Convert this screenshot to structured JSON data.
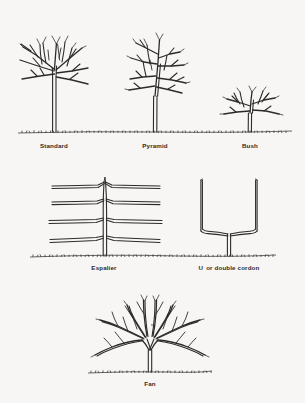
{
  "figure": {
    "background_color": "#f7f6f4",
    "ink_color": "#2b2b2b"
  },
  "rows": [
    {
      "name": "free-standing-forms",
      "items": [
        {
          "key": "standard",
          "label": "Standard"
        },
        {
          "key": "pyramid",
          "label": "Pyramid"
        },
        {
          "key": "bush",
          "label": "Bush"
        }
      ]
    },
    {
      "name": "trained-forms",
      "items": [
        {
          "key": "espalier",
          "label": "Espalier"
        },
        {
          "key": "u-cordon",
          "label_lead": "U",
          "label_rest": "or double cordon",
          "label": "U   or double cordon"
        }
      ]
    },
    {
      "name": "fan-form",
      "items": [
        {
          "key": "fan",
          "label": "Fan"
        }
      ]
    }
  ],
  "captions": {
    "standard": "Standard",
    "pyramid": "Pyramid",
    "bush": "Bush",
    "espalier": "Espalier",
    "u_cordon_lead": "U",
    "u_cordon_rest": "or double cordon",
    "fan": "Fan"
  },
  "diagram_details": {
    "standard": {
      "trunk_height_px": 60,
      "branch_tiers": 3,
      "description": "tall clear trunk with open branching head"
    },
    "pyramid": {
      "trunk_height_px": 45,
      "branch_tiers": 4,
      "description": "central leader with tiered lateral branches"
    },
    "bush": {
      "trunk_height_px": 22,
      "branch_tiers": 2,
      "description": "short trunk with low spreading head"
    },
    "espalier": {
      "tiers": 4,
      "description": "vertical stem with four pairs of horizontal arms"
    },
    "u_cordon": {
      "arms": 2,
      "description": "short trunk splitting into two vertical arms forming a U"
    },
    "fan": {
      "ribs": 10,
      "description": "short trunk splitting into radiating fan ribs"
    }
  }
}
